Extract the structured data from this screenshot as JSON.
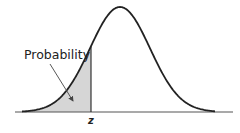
{
  "diagram": {
    "title": "",
    "type": "normal-distribution-cdf",
    "annotation_label": "Probability",
    "z_label": "z",
    "colors": {
      "curve": "#222222",
      "axis": "#555555",
      "shade": "#d6d6d6",
      "arrow": "#444444",
      "background": "#ffffff"
    },
    "geometry": {
      "axis_y": 112,
      "axis_x_start": 15,
      "axis_x_end": 233,
      "mean_x": 120,
      "peak_y": 7,
      "sigma_px": 30,
      "z_x": 91,
      "curve_x_start": 22,
      "curve_x_end": 215
    }
  }
}
